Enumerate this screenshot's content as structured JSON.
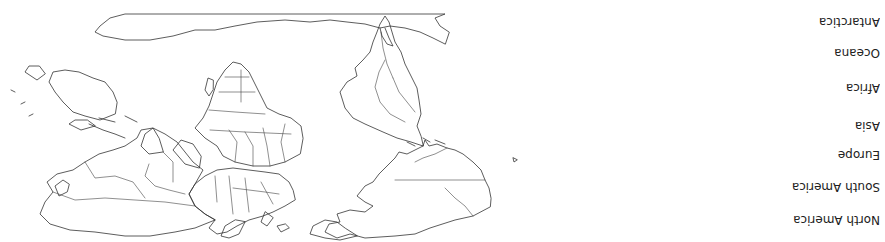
{
  "map": {
    "title": "",
    "orientation": "rotated-180",
    "stroke_color": "#333333",
    "background": "#ffffff",
    "regions": [
      "North America",
      "South America",
      "Europe",
      "Asia",
      "Africa",
      "Oceana",
      "Antarctica"
    ]
  },
  "legend": {
    "items": [
      {
        "label": "North America"
      },
      {
        "label": "South America"
      },
      {
        "label": "Europe"
      },
      {
        "label": "Asia"
      },
      {
        "label": "Africa"
      },
      {
        "label": "Oceana"
      },
      {
        "label": "Antarctica"
      }
    ]
  }
}
